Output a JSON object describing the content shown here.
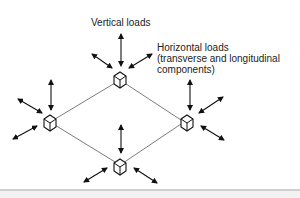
{
  "diagram": {
    "labels": {
      "vertical": "Vertical loads",
      "horizontal_line1": "Horizontal loads",
      "horizontal_line2": "(transverse and longitudinal",
      "horizontal_line3": "components)"
    },
    "nodes": [
      {
        "id": "top",
        "x": 120,
        "y": 80
      },
      {
        "id": "left",
        "x": 50,
        "y": 122
      },
      {
        "id": "right",
        "x": 184,
        "y": 122
      },
      {
        "id": "bottom",
        "x": 120,
        "y": 165
      }
    ],
    "colors": {
      "stroke": "#111111",
      "connector": "#444444",
      "text": "#222222"
    }
  }
}
